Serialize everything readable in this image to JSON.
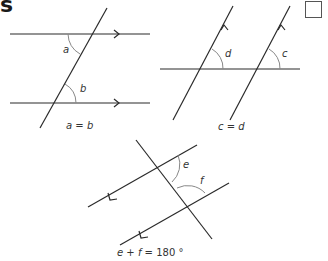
{
  "heading": {
    "visible_fragment": "s"
  },
  "checkbox": {
    "checked": false
  },
  "diagrams": [
    {
      "id": "corresponding-angles",
      "angle_labels": {
        "top": "a",
        "bottom": "b"
      },
      "caption_parts": [
        "a",
        " = ",
        "b"
      ],
      "caption": "a = b"
    },
    {
      "id": "corresponding-angles-2",
      "angle_labels": {
        "left": "d",
        "right": "c"
      },
      "caption_parts": [
        "c",
        " = ",
        "d"
      ],
      "caption": "c = d"
    },
    {
      "id": "co-interior-angles",
      "angle_labels": {
        "upper": "e",
        "lower": "f"
      },
      "caption_parts": [
        "e",
        " + ",
        "f",
        " = 180 °"
      ],
      "caption": "e + f = 180 °"
    }
  ],
  "colors": {
    "line": "#2a2a2a",
    "arc": "#888888",
    "text": "#333333"
  }
}
